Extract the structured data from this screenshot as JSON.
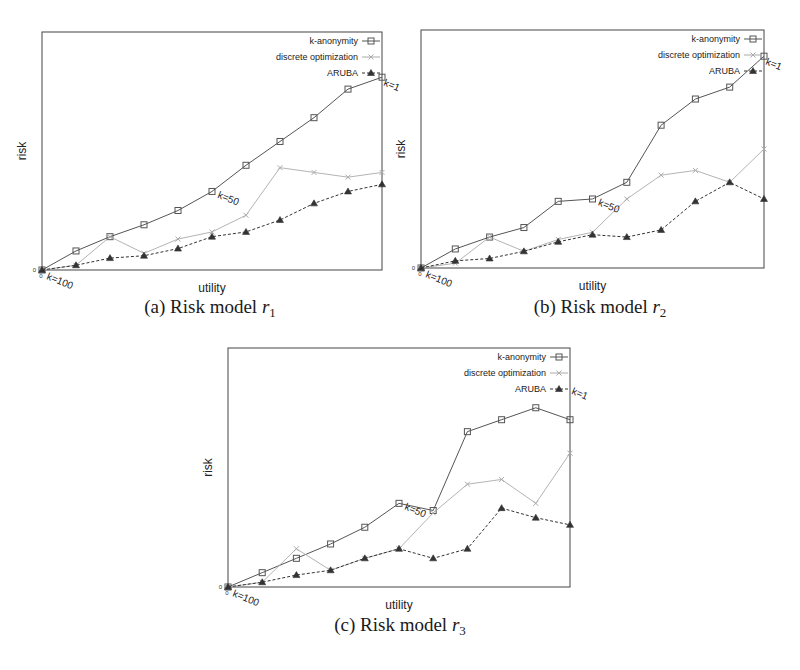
{
  "figure": {
    "panels": [
      {
        "id": "a",
        "caption_prefix": "(a) Risk model ",
        "caption_var": "r",
        "caption_sub": "1"
      },
      {
        "id": "b",
        "caption_prefix": "(b) Risk model ",
        "caption_var": "r",
        "caption_sub": "2"
      },
      {
        "id": "c",
        "caption_prefix": "(c) Risk model ",
        "caption_var": "r",
        "caption_sub": "3"
      }
    ]
  },
  "colors": {
    "k_anonymity": "#555555",
    "discrete_optimization": "#aaaaaa",
    "aruba": "#333333",
    "axes": "#444444"
  },
  "chart_data": [
    {
      "type": "line",
      "title": "(a) Risk model r1",
      "xlabel": "utility",
      "ylabel": "risk",
      "x_tick_labels": [
        "0"
      ],
      "y_tick_labels": [
        "0"
      ],
      "grid": false,
      "legend_position": "upper right",
      "annotations": [
        "k=100",
        "k=50",
        "k=1"
      ],
      "x": [
        0,
        1,
        2,
        3,
        4,
        5,
        6,
        7,
        8,
        9,
        10
      ],
      "ylim": [
        0,
        100
      ],
      "series": [
        {
          "name": "k-anonymity",
          "marker": "square",
          "values": [
            0,
            8,
            14,
            19,
            25,
            33,
            44,
            54,
            64,
            76,
            81
          ]
        },
        {
          "name": "discrete optimization",
          "marker": "x",
          "values": [
            0,
            2,
            14,
            7,
            13,
            16,
            23,
            43,
            41,
            39,
            41
          ]
        },
        {
          "name": "ARUBA",
          "marker": "triangle",
          "values": [
            0,
            2,
            5,
            6,
            9,
            14,
            16,
            21,
            28,
            33,
            36
          ]
        }
      ]
    },
    {
      "type": "line",
      "title": "(b) Risk model r2",
      "xlabel": "utility",
      "ylabel": "risk",
      "x_tick_labels": [
        "0"
      ],
      "y_tick_labels": [
        "0"
      ],
      "grid": false,
      "legend_position": "upper right",
      "annotations": [
        "k=100",
        "k=50",
        "k=1"
      ],
      "x": [
        0,
        1,
        2,
        3,
        4,
        5,
        6,
        7,
        8,
        9,
        10
      ],
      "ylim": [
        0,
        100
      ],
      "series": [
        {
          "name": "k-anonymity",
          "marker": "square",
          "values": [
            0,
            8,
            13,
            17,
            28,
            29,
            36,
            60,
            71,
            76,
            89
          ]
        },
        {
          "name": "discrete optimization",
          "marker": "x",
          "values": [
            0,
            2,
            13,
            7,
            12,
            15,
            29,
            39,
            41,
            36,
            50
          ]
        },
        {
          "name": "ARUBA",
          "marker": "triangle",
          "values": [
            0,
            3,
            4,
            7,
            11,
            14,
            13,
            16,
            28,
            36,
            29
          ]
        }
      ]
    },
    {
      "type": "line",
      "title": "(c) Risk model r3",
      "xlabel": "utility",
      "ylabel": "risk",
      "x_tick_labels": [
        "0"
      ],
      "y_tick_labels": [
        "0"
      ],
      "grid": false,
      "legend_position": "upper right",
      "annotations": [
        "k=100",
        "k=50",
        "k=1"
      ],
      "x": [
        0,
        1,
        2,
        3,
        4,
        5,
        6,
        7,
        8,
        9,
        10
      ],
      "ylim": [
        0,
        100
      ],
      "series": [
        {
          "name": "k-anonymity",
          "marker": "square",
          "values": [
            0,
            6,
            12,
            18,
            25,
            35,
            32,
            65,
            70,
            75,
            70
          ]
        },
        {
          "name": "discrete optimization",
          "marker": "x",
          "values": [
            0,
            2,
            16,
            7,
            12,
            16,
            31,
            43,
            45,
            35,
            56
          ]
        },
        {
          "name": "ARUBA",
          "marker": "triangle",
          "values": [
            0,
            2,
            5,
            7,
            12,
            16,
            12,
            16,
            33,
            29,
            26
          ]
        }
      ]
    }
  ]
}
